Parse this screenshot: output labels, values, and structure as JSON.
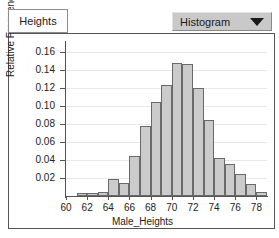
{
  "window": {
    "tab_label": "Heights"
  },
  "toolbar": {
    "plot_type_selected": "Histogram",
    "dropdown_arrow_icon": "chevron-down-icon"
  },
  "chart_data": {
    "type": "bar",
    "title": "",
    "xlabel": "Male_Heights",
    "ylabel": "Relative Frequency",
    "grid": true,
    "legend": "none",
    "xlim": [
      60,
      79
    ],
    "ylim": [
      0,
      0.17
    ],
    "xticks": [
      60,
      62,
      64,
      66,
      68,
      70,
      72,
      74,
      76,
      78
    ],
    "xtick_labels": [
      "60",
      "62",
      "64",
      "66",
      "68",
      "70",
      "72",
      "74",
      "76",
      "78"
    ],
    "yticks": [
      0.02,
      0.04,
      0.06,
      0.08,
      0.1,
      0.12,
      0.14,
      0.16
    ],
    "ytick_labels": [
      "0.02",
      "0.04",
      "0.06",
      "0.08",
      "0.10",
      "0.12",
      "0.14",
      "0.16"
    ],
    "bin_width": 1,
    "bin_starts": [
      60,
      61,
      62,
      63,
      64,
      65,
      66,
      67,
      68,
      69,
      70,
      71,
      72,
      73,
      74,
      75,
      76,
      77,
      78
    ],
    "values": [
      0.0,
      0.003,
      0.003,
      0.004,
      0.019,
      0.015,
      0.045,
      0.078,
      0.105,
      0.123,
      0.148,
      0.147,
      0.12,
      0.085,
      0.042,
      0.036,
      0.025,
      0.013,
      0.005
    ],
    "bar_fill_color": "#cbcbcb",
    "bar_edge_color": "#6a6a6a"
  }
}
